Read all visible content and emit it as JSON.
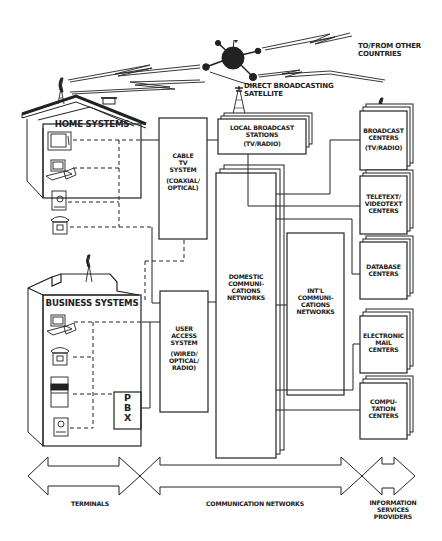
{
  "diagram": {
    "satellite": {
      "label_line1": "DIRECT BROADCASTING",
      "label_line2": "SATELLITE"
    },
    "other_countries": {
      "line1": "TO/FROM OTHER",
      "line2": "COUNTRIES"
    },
    "home": {
      "title": "HOME SYSTEMS",
      "devices": [
        "television",
        "computer",
        "videotext-terminal",
        "telephone"
      ]
    },
    "business": {
      "title": "BUSINESS SYSTEMS",
      "devices": [
        "computer",
        "telephone",
        "facsimile",
        "terminal"
      ],
      "pbx": {
        "l1": "P",
        "l2": "B",
        "l3": "X"
      }
    },
    "cable_tv": {
      "l1": "CABLE",
      "l2": "TV",
      "l3": "SYSTEM",
      "l4": "(COAXIAL/",
      "l5": "OPTICAL)"
    },
    "user_access": {
      "l1": "USER",
      "l2": "ACCESS",
      "l3": "SYSTEM",
      "l4": "(WIRED/",
      "l5": "OPTICAL/",
      "l6": "RADIO)"
    },
    "local_broadcast": {
      "l1": "LOCAL BROADCAST",
      "l2": "STATIONS",
      "l3": "(TV/RADIO)"
    },
    "domestic": {
      "l1": "DOMESTIC",
      "l2": "COMMUNI-",
      "l3": "CATIONS",
      "l4": "NETWORKS"
    },
    "intl": {
      "l1": "INT'L",
      "l2": "COMMUNI-",
      "l3": "CATIONS",
      "l4": "NETWORKS"
    },
    "providers": [
      {
        "l1": "BROADCAST",
        "l2": "CENTERS",
        "l3": "(TV/RADIO)"
      },
      {
        "l1": "TELETEXT/",
        "l2": "VIDEOTEXT",
        "l3": "CENTERS"
      },
      {
        "l1": "DATABASE",
        "l2": "CENTERS"
      },
      {
        "l1": "ELECTRONIC",
        "l2": "MAIL",
        "l3": "CENTERS"
      },
      {
        "l1": "COMPU-",
        "l2": "TATION",
        "l3": "CENTERS"
      }
    ],
    "bottom": {
      "terminals": "TERMINALS",
      "networks": "COMMUNICATION NETWORKS",
      "isp_l1": "INFORMATION",
      "isp_l2": "SERVICES",
      "isp_l3": "PROVIDERS"
    },
    "colors": {
      "line": "#222222",
      "background": "#ffffff"
    }
  }
}
